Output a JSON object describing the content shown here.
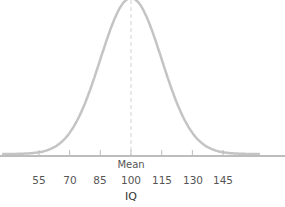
{
  "chart_data": {
    "type": "line",
    "title": "",
    "xlabel": "IQ",
    "ylabel": "",
    "annotation": "Mean",
    "mean": 100,
    "sd": 15,
    "x_ticks": [
      55,
      70,
      85,
      100,
      115,
      130,
      145
    ],
    "tick_labels": [
      "55",
      "70",
      "85",
      "100",
      "115",
      "130",
      "145"
    ],
    "xlim": [
      40,
      165
    ],
    "grid": false,
    "legend": null,
    "series": [
      {
        "name": "Normal distribution",
        "distribution": "normal",
        "mean": 100,
        "sd": 15
      }
    ],
    "colors": {
      "curve": "#c4c4c4",
      "axis": "#bdbdbd",
      "mean_line": "#d0d0d0"
    }
  },
  "labels": {
    "mean": "Mean",
    "xlabel": "IQ",
    "ticks": [
      "55",
      "70",
      "85",
      "100",
      "115",
      "130",
      "145"
    ]
  }
}
